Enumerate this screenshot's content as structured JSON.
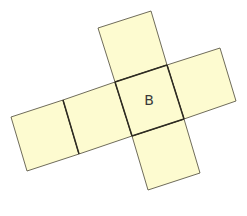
{
  "diagram": {
    "type": "cube-net",
    "faces": [
      {
        "id": "top",
        "label": ""
      },
      {
        "id": "center",
        "label": "B"
      },
      {
        "id": "right",
        "label": ""
      },
      {
        "id": "middle-left",
        "label": ""
      },
      {
        "id": "far-left",
        "label": ""
      },
      {
        "id": "bottom",
        "label": ""
      }
    ],
    "fill_color": "#fdfbd0",
    "edge_color": "#4a4636"
  }
}
